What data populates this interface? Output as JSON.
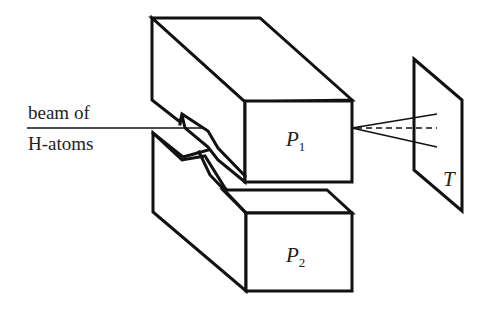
{
  "figure": {
    "type": "apparatus-diagram",
    "beam_label_line1": "beam of",
    "beam_label_line2": "H-atoms",
    "upper_pole": {
      "symbol": "P",
      "subscript": "1"
    },
    "lower_pole": {
      "symbol": "P",
      "subscript": "2"
    },
    "screen": {
      "symbol": "T"
    },
    "colors": {
      "stroke": "#111111",
      "background": "#ffffff",
      "text": "#222222"
    }
  }
}
